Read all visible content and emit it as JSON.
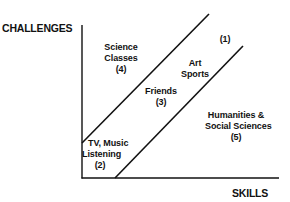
{
  "diagram": {
    "y_axis_label": "CHALLENGES",
    "x_axis_label": "SKILLS",
    "colors": {
      "ink": "#111111",
      "background": "#ffffff"
    },
    "regions": [
      {
        "id": "1",
        "lines": [
          "Art",
          "Sports"
        ],
        "number": "(1)"
      },
      {
        "id": "2",
        "lines": [
          "TV, Music",
          "Listening"
        ],
        "number": "(2)"
      },
      {
        "id": "3",
        "lines": [
          "Friends"
        ],
        "number": "(3)"
      },
      {
        "id": "4",
        "lines": [
          "Science",
          "Classes"
        ],
        "number": "(4)"
      },
      {
        "id": "5",
        "lines": [
          "Humanities &",
          "Social Sciences"
        ],
        "number": "(5)"
      }
    ]
  }
}
